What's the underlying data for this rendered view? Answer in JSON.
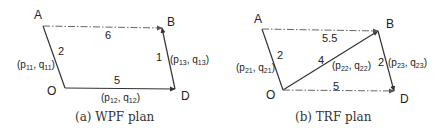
{
  "figures": [
    {
      "id": "a",
      "caption": "(a) WPF plan",
      "nodes": {
        "A": "A",
        "B": "B",
        "O": "O",
        "D": "D"
      },
      "edges": [
        {
          "from": "A",
          "to": "O",
          "label": "2",
          "style": "solid",
          "arrow": false
        },
        {
          "from": "O",
          "to": "D",
          "label": "5",
          "style": "solid",
          "arrow": true
        },
        {
          "from": "D",
          "to": "B",
          "label": "1",
          "style": "solid",
          "arrow": true
        },
        {
          "from": "A",
          "to": "B",
          "label": "6",
          "style": "dash-dot",
          "arrow": true
        }
      ],
      "path_labels": [
        {
          "p": "p",
          "psub": "11",
          "q": "q",
          "qsub": "11"
        },
        {
          "p": "p",
          "psub": "12",
          "q": "q",
          "qsub": "12"
        },
        {
          "p": "p",
          "psub": "13",
          "q": "q",
          "qsub": "13"
        }
      ]
    },
    {
      "id": "b",
      "caption": "(b) TRF plan",
      "nodes": {
        "A": "A",
        "B": "B",
        "O": "O",
        "D": "D"
      },
      "edges": [
        {
          "from": "A",
          "to": "O",
          "label": "2",
          "style": "solid",
          "arrow": false
        },
        {
          "from": "O",
          "to": "B",
          "label": "4",
          "style": "solid",
          "arrow": true
        },
        {
          "from": "B",
          "to": "D",
          "label": "2",
          "style": "solid",
          "arrow": true
        },
        {
          "from": "A",
          "to": "B",
          "label": "5.5",
          "style": "dash-dot",
          "arrow": true
        },
        {
          "from": "O",
          "to": "D",
          "label": "5",
          "style": "dash-dot",
          "arrow": true
        }
      ],
      "path_labels": [
        {
          "p": "p",
          "psub": "21",
          "q": "q",
          "qsub": "21"
        },
        {
          "p": "p",
          "psub": "22",
          "q": "q",
          "qsub": "22"
        },
        {
          "p": "p",
          "psub": "23",
          "q": "q",
          "qsub": "23"
        }
      ]
    }
  ]
}
